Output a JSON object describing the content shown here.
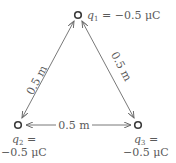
{
  "diagram": {
    "type": "point-charge-triangle",
    "colors": {
      "line": "#6a6a6a",
      "charge": "#3a3a3a",
      "text": "#5a5a5a"
    },
    "charges": [
      {
        "id": "q1",
        "symbol": "q",
        "subscript": "1",
        "eq": " = ",
        "value": "−0.5 μC"
      },
      {
        "id": "q2",
        "symbol": "q",
        "subscript": "2",
        "eq": " =",
        "value": "−0.5 μC"
      },
      {
        "id": "q3",
        "symbol": "q",
        "subscript": "3",
        "eq": " =",
        "value": "−0.5 μC"
      }
    ],
    "distances": [
      {
        "between": "q1-q2",
        "label": "0.5 m"
      },
      {
        "between": "q1-q3",
        "label": "0.5 m"
      },
      {
        "between": "q2-q3",
        "label": "0.5 m"
      }
    ]
  }
}
